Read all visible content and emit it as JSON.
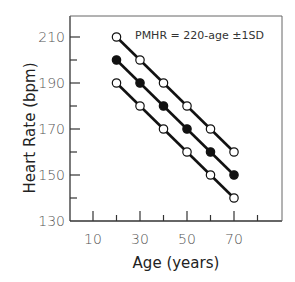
{
  "chart_data": {
    "type": "line",
    "title": "",
    "annotation": "PMHR = 220-age ±1SD",
    "xlabel": "Age (years)",
    "ylabel": "Heart Rate (bpm)",
    "x": [
      20,
      30,
      40,
      50,
      60,
      70
    ],
    "xlim": [
      0,
      85
    ],
    "ylim": [
      130,
      215
    ],
    "x_ticks": [
      "10",
      "30",
      "50",
      "70"
    ],
    "y_ticks": [
      "210",
      "190",
      "170",
      "150",
      "130"
    ],
    "grid": false,
    "legend": "none",
    "series": [
      {
        "name": "+1SD",
        "marker": "open-circle",
        "values": [
          210,
          200,
          190,
          180,
          170,
          160
        ]
      },
      {
        "name": "PMHR (220-age)",
        "marker": "filled-circle",
        "values": [
          200,
          190,
          180,
          170,
          160,
          150
        ]
      },
      {
        "name": "-1SD",
        "marker": "open-circle",
        "values": [
          190,
          180,
          170,
          160,
          150,
          140
        ]
      }
    ]
  }
}
